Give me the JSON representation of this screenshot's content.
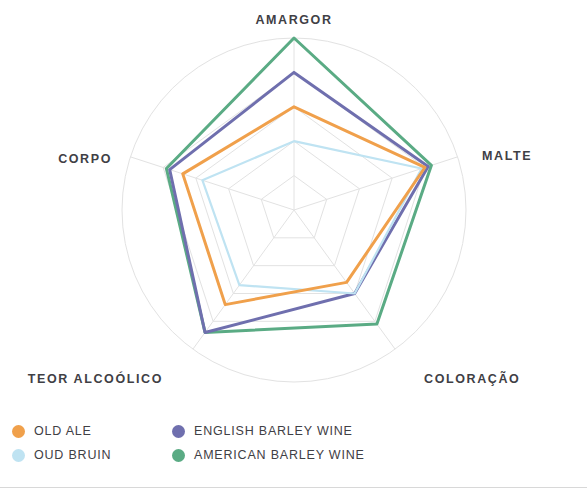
{
  "chart_data": {
    "type": "radar",
    "title": "",
    "categories": [
      "AMARGOR",
      "MALTE",
      "COLORAÇÃO",
      "TEOR ALCOÓLICO",
      "CORPO"
    ],
    "rmax": 5,
    "rings": 5,
    "grid": true,
    "legend_position": "bottom-left",
    "series": [
      {
        "name": "OLD ALE",
        "color": "#f0a04b",
        "values": [
          3.0,
          4.0,
          2.6,
          3.4,
          3.4
        ]
      },
      {
        "name": "OUD BRUIN",
        "color": "#bfe3f2",
        "values": [
          2.0,
          3.9,
          3.0,
          2.7,
          2.8
        ]
      },
      {
        "name": "ENGLISH BARLEY WINE",
        "color": "#6f6fae",
        "values": [
          4.0,
          4.1,
          3.0,
          4.4,
          3.8
        ]
      },
      {
        "name": "AMERICAN BARLEY WINE",
        "color": "#5aab84",
        "values": [
          5.0,
          4.2,
          4.1,
          4.4,
          3.9
        ]
      }
    ]
  },
  "axis_labels": [
    {
      "text": "AMARGOR"
    },
    {
      "text": "MALTE"
    },
    {
      "text": "COLORAÇÃO"
    },
    {
      "text": "TEOR ALCOÓLICO"
    },
    {
      "text": "CORPO"
    }
  ],
  "legend": {
    "items": [
      {
        "label": "OLD ALE",
        "color": "#f0a04b"
      },
      {
        "label": "ENGLISH BARLEY WINE",
        "color": "#6f6fae"
      },
      {
        "label": "OUD BRUIN",
        "color": "#bfe3f2"
      },
      {
        "label": "AMERICAN BARLEY WINE",
        "color": "#5aab84"
      }
    ]
  },
  "colors": {
    "grid": "#e2e2e2",
    "text": "#3f4045",
    "background": "#ffffff",
    "rule": "#d8d8d8"
  }
}
